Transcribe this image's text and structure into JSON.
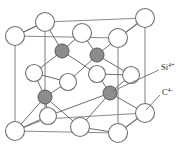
{
  "figure": {
    "name": "zinc-blende-silicon-carbide-unit-cell",
    "title": "",
    "caption": "",
    "background_color": "#ffffff"
  },
  "legend": {
    "items": [
      {
        "id": "cation",
        "base": "Si",
        "charge": "4+",
        "full_label": "Si4+",
        "marker": "filled-circle",
        "color": "#8c8c8c",
        "leader_from": [
          110,
          93
        ],
        "leader_to": [
          160,
          70
        ]
      },
      {
        "id": "anion",
        "base": "C",
        "charge": "4-",
        "full_label": "C4-",
        "marker": "open-circle",
        "color": "#ffffff",
        "leader_from": [
          143,
          113
        ],
        "leader_to": [
          160,
          93
        ]
      }
    ]
  },
  "colors": {
    "cation_fill": "#8c8c8c",
    "cation_stroke": "#5a5a5a",
    "anion_fill": "#ffffff",
    "anion_stroke": "#707070",
    "cube_edge": "#8a8a8a",
    "bond": "#6d6d6d",
    "text": "#1a1a1a"
  },
  "geometry": {
    "cube_vertices": {
      "back_top_left": [
        45,
        22
      ],
      "back_top_right": [
        145,
        18
      ],
      "back_bottom_left": [
        45,
        119
      ],
      "back_bottom_right": [
        145,
        113
      ],
      "front_top_left": [
        15,
        36
      ],
      "front_top_right": [
        118,
        38
      ],
      "front_bottom_left": [
        15,
        131
      ],
      "front_bottom_right": [
        118,
        133
      ]
    },
    "cube_edge_count": 12,
    "anion_count": 14,
    "cation_count": 4
  },
  "atoms": {
    "anions": [
      {
        "id": "c-1",
        "cx": 45,
        "cy": 22,
        "r": 9.5,
        "site": "corner"
      },
      {
        "id": "c-2",
        "cx": 145,
        "cy": 18,
        "r": 9.5,
        "site": "corner"
      },
      {
        "id": "c-3",
        "cx": 15,
        "cy": 36,
        "r": 9.5,
        "site": "corner"
      },
      {
        "id": "c-4",
        "cx": 118,
        "cy": 38,
        "r": 9.5,
        "site": "corner"
      },
      {
        "id": "c-5",
        "cx": 15,
        "cy": 131,
        "r": 9.5,
        "site": "corner"
      },
      {
        "id": "c-6",
        "cx": 118,
        "cy": 133,
        "r": 9.5,
        "site": "corner"
      },
      {
        "id": "c-7",
        "cx": 145,
        "cy": 113,
        "r": 9.5,
        "site": "corner"
      },
      {
        "id": "c-8",
        "cx": 82,
        "cy": 33,
        "r": 9.5,
        "site": "top-face-center"
      },
      {
        "id": "c-9",
        "cx": 80,
        "cy": 127,
        "r": 9.5,
        "site": "bottom-face-center"
      },
      {
        "id": "c-10",
        "cx": 34,
        "cy": 73,
        "r": 8.5,
        "site": "left-face-center"
      },
      {
        "id": "c-11",
        "cx": 131,
        "cy": 75,
        "r": 8.5,
        "site": "right-face-center"
      },
      {
        "id": "c-12",
        "cx": 97,
        "cy": 74,
        "r": 8.5,
        "site": "back-face-center"
      },
      {
        "id": "c-13",
        "cx": 68,
        "cy": 82,
        "r": 8.5,
        "site": "front-face-center"
      },
      {
        "id": "c-14",
        "cx": 48,
        "cy": 116,
        "r": 8.5,
        "site": "front-bottom-interior"
      }
    ],
    "cations": [
      {
        "id": "si-1",
        "cx": 62,
        "cy": 51,
        "r": 7.0,
        "site": "tetrahedral-interior"
      },
      {
        "id": "si-2",
        "cx": 97,
        "cy": 55,
        "r": 7.0,
        "site": "tetrahedral-interior"
      },
      {
        "id": "si-3",
        "cx": 45,
        "cy": 97,
        "r": 7.0,
        "site": "tetrahedral-interior"
      },
      {
        "id": "si-4",
        "cx": 110,
        "cy": 93,
        "r": 7.0,
        "site": "tetrahedral-interior"
      }
    ]
  }
}
